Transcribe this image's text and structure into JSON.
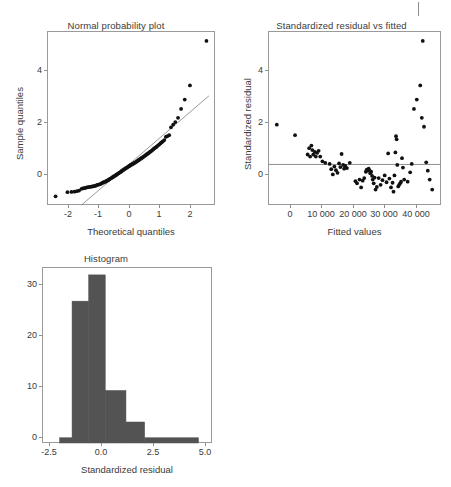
{
  "figure": {
    "background": "#ffffff",
    "point_color": "#111111",
    "line_color": "#9a9a9a",
    "bar_color": "#535353",
    "axis_color": "#8e8e8e"
  },
  "panels": {
    "qq": {
      "title": "Normal probability plot",
      "xlabel": "Theoretical quantiles",
      "ylabel": "Sample quantiles",
      "xticks": [
        "-2",
        "-1",
        "0",
        "1",
        "2"
      ],
      "yticks": [
        "0",
        "2",
        "4"
      ]
    },
    "resid": {
      "title": "Standardized residual vs fitted",
      "xlabel": "Fitted values",
      "ylabel": "Standardized residual",
      "xticks": [
        "0",
        "10 000",
        "20 000",
        "30 000",
        "40 000"
      ],
      "yticks": [
        "0",
        "2",
        "4"
      ]
    },
    "hist": {
      "title": "Histogram",
      "xlabel": "Standardized residual",
      "ylabel": "",
      "xticks": [
        "-2.5",
        "0.0",
        "2.5",
        "5.0"
      ],
      "yticks": [
        "0",
        "10",
        "20",
        "30"
      ]
    }
  },
  "chart_data": [
    {
      "type": "scatter",
      "id": "normal-probability-plot",
      "title": "Normal probability plot",
      "xlabel": "Theoretical quantiles",
      "ylabel": "Sample quantiles",
      "xlim": [
        -2.75,
        2.75
      ],
      "ylim": [
        -1.55,
        5.1
      ],
      "xticks": [
        -2,
        -1,
        0,
        1,
        2
      ],
      "yticks": [
        0,
        2,
        4
      ],
      "grid": false,
      "legend": null,
      "reference_line": {
        "type": "qq-line",
        "x": [
          -1.62,
          2.55
        ],
        "y": [
          -1.55,
          2.62
        ],
        "color": "#9a9a9a"
      },
      "points": [
        [
          -2.47,
          -1.22
        ],
        [
          -2.08,
          -1.06
        ],
        [
          -1.95,
          -1.05
        ],
        [
          -1.85,
          -1.04
        ],
        [
          -1.77,
          -1.02
        ],
        [
          -1.7,
          -1.0
        ],
        [
          -1.62,
          -0.93
        ],
        [
          -1.56,
          -0.91
        ],
        [
          -1.5,
          -0.9
        ],
        [
          -1.45,
          -0.88
        ],
        [
          -1.4,
          -0.87
        ],
        [
          -1.35,
          -0.86
        ],
        [
          -1.3,
          -0.85
        ],
        [
          -1.26,
          -0.84
        ],
        [
          -1.22,
          -0.83
        ],
        [
          -1.18,
          -0.82
        ],
        [
          -1.14,
          -0.8
        ],
        [
          -1.1,
          -0.78
        ],
        [
          -1.06,
          -0.77
        ],
        [
          -1.03,
          -0.76
        ],
        [
          -0.99,
          -0.74
        ],
        [
          -0.96,
          -0.72
        ],
        [
          -0.93,
          -0.7
        ],
        [
          -0.89,
          -0.68
        ],
        [
          -0.86,
          -0.67
        ],
        [
          -0.83,
          -0.65
        ],
        [
          -0.8,
          -0.63
        ],
        [
          -0.77,
          -0.61
        ],
        [
          -0.74,
          -0.59
        ],
        [
          -0.71,
          -0.57
        ],
        [
          -0.69,
          -0.55
        ],
        [
          -0.66,
          -0.53
        ],
        [
          -0.63,
          -0.51
        ],
        [
          -0.6,
          -0.49
        ],
        [
          -0.58,
          -0.47
        ],
        [
          -0.55,
          -0.45
        ],
        [
          -0.52,
          -0.43
        ],
        [
          -0.5,
          -0.41
        ],
        [
          -0.47,
          -0.39
        ],
        [
          -0.45,
          -0.37
        ],
        [
          -0.42,
          -0.35
        ],
        [
          -0.4,
          -0.33
        ],
        [
          -0.37,
          -0.31
        ],
        [
          -0.35,
          -0.29
        ],
        [
          -0.32,
          -0.27
        ],
        [
          -0.3,
          -0.25
        ],
        [
          -0.28,
          -0.23
        ],
        [
          -0.25,
          -0.21
        ],
        [
          -0.23,
          -0.19
        ],
        [
          -0.2,
          -0.17
        ],
        [
          -0.18,
          -0.15
        ],
        [
          -0.16,
          -0.14
        ],
        [
          -0.13,
          -0.12
        ],
        [
          -0.11,
          -0.1
        ],
        [
          -0.09,
          -0.08
        ],
        [
          -0.06,
          -0.06
        ],
        [
          -0.04,
          -0.05
        ],
        [
          -0.02,
          -0.03
        ],
        [
          0.01,
          -0.01
        ],
        [
          0.03,
          0.0
        ],
        [
          0.05,
          0.02
        ],
        [
          0.08,
          0.03
        ],
        [
          0.1,
          0.05
        ],
        [
          0.12,
          0.07
        ],
        [
          0.15,
          0.08
        ],
        [
          0.17,
          0.1
        ],
        [
          0.19,
          0.12
        ],
        [
          0.22,
          0.14
        ],
        [
          0.24,
          0.16
        ],
        [
          0.27,
          0.18
        ],
        [
          0.29,
          0.2
        ],
        [
          0.32,
          0.22
        ],
        [
          0.34,
          0.24
        ],
        [
          0.37,
          0.26
        ],
        [
          0.39,
          0.28
        ],
        [
          0.42,
          0.3
        ],
        [
          0.45,
          0.33
        ],
        [
          0.47,
          0.35
        ],
        [
          0.5,
          0.37
        ],
        [
          0.53,
          0.4
        ],
        [
          0.56,
          0.42
        ],
        [
          0.59,
          0.45
        ],
        [
          0.62,
          0.48
        ],
        [
          0.65,
          0.5
        ],
        [
          0.68,
          0.53
        ],
        [
          0.71,
          0.56
        ],
        [
          0.74,
          0.59
        ],
        [
          0.77,
          0.62
        ],
        [
          0.81,
          0.65
        ],
        [
          0.84,
          0.68
        ],
        [
          0.88,
          0.72
        ],
        [
          0.92,
          0.76
        ],
        [
          0.96,
          0.8
        ],
        [
          1.0,
          0.84
        ],
        [
          1.04,
          0.88
        ],
        [
          1.09,
          0.93
        ],
        [
          1.14,
          1.05
        ],
        [
          1.19,
          1.08
        ],
        [
          1.25,
          1.12
        ],
        [
          1.31,
          1.42
        ],
        [
          1.38,
          1.52
        ],
        [
          1.45,
          1.62
        ],
        [
          1.54,
          1.78
        ],
        [
          1.64,
          2.12
        ],
        [
          1.76,
          2.48
        ],
        [
          1.93,
          3.02
        ],
        [
          2.47,
          4.72
        ]
      ]
    },
    {
      "type": "scatter",
      "id": "standardized-residual-vs-fitted",
      "title": "Standardized residual vs fitted",
      "xlabel": "Fitted values",
      "ylabel": "Standardized residual",
      "xlim": [
        -7000,
        48000
      ],
      "ylim": [
        -1.55,
        5.1
      ],
      "xticks": [
        0,
        10000,
        20000,
        30000,
        40000
      ],
      "yticks": [
        0,
        2,
        4
      ],
      "grid": false,
      "legend": null,
      "reference_line": {
        "type": "horizontal",
        "y": 0,
        "color": "#8e8e8e"
      },
      "points": [
        [
          -4200,
          1.52
        ],
        [
          1600,
          1.12
        ],
        [
          5600,
          0.38
        ],
        [
          6100,
          0.62
        ],
        [
          6400,
          0.3
        ],
        [
          6800,
          0.72
        ],
        [
          7100,
          0.55
        ],
        [
          7400,
          0.38
        ],
        [
          7900,
          0.48
        ],
        [
          8200,
          0.3
        ],
        [
          8600,
          0.44
        ],
        [
          9100,
          0.52
        ],
        [
          9600,
          0.3
        ],
        [
          10300,
          0.12
        ],
        [
          11200,
          0.06
        ],
        [
          12600,
          0.02
        ],
        [
          13100,
          -0.18
        ],
        [
          13600,
          -0.38
        ],
        [
          14100,
          -0.08
        ],
        [
          14600,
          -0.22
        ],
        [
          15100,
          -0.32
        ],
        [
          15600,
          0.04
        ],
        [
          16000,
          -0.1
        ],
        [
          16400,
          0.4
        ],
        [
          16900,
          -0.02
        ],
        [
          17200,
          -0.16
        ],
        [
          17600,
          -0.06
        ],
        [
          18100,
          -0.14
        ],
        [
          19000,
          0.06
        ],
        [
          20800,
          -0.64
        ],
        [
          21300,
          -0.72
        ],
        [
          22100,
          -0.58
        ],
        [
          22600,
          -0.88
        ],
        [
          23100,
          -0.62
        ],
        [
          23600,
          -0.52
        ],
        [
          24100,
          -0.28
        ],
        [
          24400,
          -0.2
        ],
        [
          24700,
          -0.24
        ],
        [
          25000,
          -0.16
        ],
        [
          25200,
          -0.22
        ],
        [
          25500,
          -0.34
        ],
        [
          25800,
          -0.28
        ],
        [
          26100,
          -0.44
        ],
        [
          26300,
          -0.58
        ],
        [
          26600,
          -0.72
        ],
        [
          26900,
          -0.5
        ],
        [
          27200,
          -0.96
        ],
        [
          27600,
          -0.86
        ],
        [
          28200,
          -0.52
        ],
        [
          28800,
          -0.78
        ],
        [
          29400,
          -0.6
        ],
        [
          30100,
          -0.42
        ],
        [
          30700,
          -0.68
        ],
        [
          31200,
          0.42
        ],
        [
          31600,
          -0.54
        ],
        [
          32100,
          -0.88
        ],
        [
          32600,
          -0.7
        ],
        [
          32900,
          -1.04
        ],
        [
          33200,
          -0.42
        ],
        [
          33500,
          0.46
        ],
        [
          33700,
          1.08
        ],
        [
          33900,
          0.96
        ],
        [
          34100,
          -0.02
        ],
        [
          34400,
          -0.84
        ],
        [
          34700,
          -0.78
        ],
        [
          35000,
          -0.72
        ],
        [
          35300,
          -0.66
        ],
        [
          35600,
          0.24
        ],
        [
          35900,
          -0.12
        ],
        [
          36300,
          -0.58
        ],
        [
          37400,
          -0.66
        ],
        [
          38200,
          -0.3
        ],
        [
          38700,
          0.02
        ],
        [
          39400,
          2.12
        ],
        [
          40300,
          2.48
        ],
        [
          41400,
          3.02
        ],
        [
          41900,
          1.78
        ],
        [
          42200,
          4.72
        ],
        [
          42600,
          1.44
        ],
        [
          43300,
          0.08
        ],
        [
          43800,
          -0.24
        ],
        [
          44400,
          -0.58
        ],
        [
          45200,
          -0.96
        ]
      ]
    },
    {
      "type": "bar",
      "subtype": "histogram",
      "id": "histogram",
      "title": "Histogram",
      "xlabel": "Standardized residual",
      "ylabel": "",
      "xlim": [
        -2.85,
        5.35
      ],
      "ylim": [
        0,
        33.5
      ],
      "xticks": [
        -2.5,
        0.0,
        2.5,
        5.0
      ],
      "yticks": [
        0,
        10,
        20,
        30
      ],
      "grid": false,
      "legend": null,
      "bin_edges": [
        -2.0,
        -1.4,
        -0.6,
        0.2,
        1.2,
        2.1,
        4.7
      ],
      "bins": [
        {
          "left": -2.0,
          "right": -1.4,
          "count": 1
        },
        {
          "left": -1.4,
          "right": -0.6,
          "count": 27
        },
        {
          "left": -0.6,
          "right": 0.2,
          "count": 32
        },
        {
          "left": 0.2,
          "right": 1.2,
          "count": 10
        },
        {
          "left": 1.2,
          "right": 2.1,
          "count": 4
        },
        {
          "left": 2.1,
          "right": 4.7,
          "count": 1
        }
      ],
      "values": [
        1,
        27,
        32,
        10,
        4,
        1
      ],
      "categories": [
        "-2.0..-1.4",
        "-1.4..-0.6",
        "-0.6..0.2",
        "0.2..1.2",
        "1.2..2.1",
        "2.1..4.7"
      ]
    }
  ]
}
